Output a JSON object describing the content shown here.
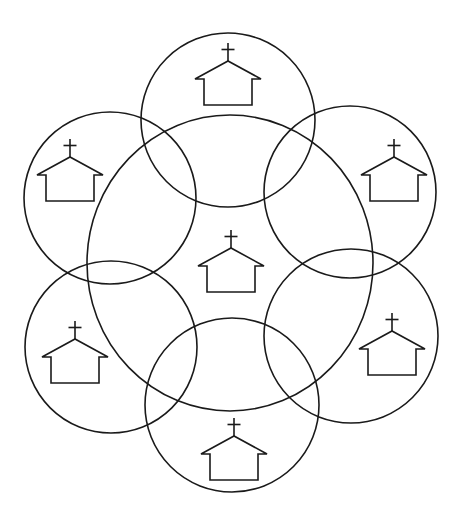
{
  "diagram": {
    "stroke_color": "#1a1a1a",
    "background_color": "#ffffff",
    "center_circle": {
      "name": "center",
      "cx": 230,
      "cy": 263,
      "rx": 143,
      "ry": 148,
      "church": {
        "x": 231,
        "y": 265
      }
    },
    "outer_circles": [
      {
        "name": "top",
        "cx": 228,
        "cy": 120,
        "r": 87,
        "church": {
          "x": 228,
          "y": 78
        }
      },
      {
        "name": "top-right",
        "cx": 350,
        "cy": 192,
        "r": 86,
        "church": {
          "x": 394,
          "y": 174
        }
      },
      {
        "name": "bottom-right",
        "cx": 351,
        "cy": 336,
        "r": 87,
        "church": {
          "x": 392,
          "y": 348
        }
      },
      {
        "name": "bottom",
        "cx": 232,
        "cy": 405,
        "r": 87,
        "church": {
          "x": 234,
          "y": 453
        }
      },
      {
        "name": "bottom-left",
        "cx": 111,
        "cy": 347,
        "r": 86,
        "church": {
          "x": 75,
          "y": 356
        }
      },
      {
        "name": "top-left",
        "cx": 110,
        "cy": 198,
        "r": 86,
        "church": {
          "x": 70,
          "y": 174
        }
      }
    ],
    "icon": "church-icon"
  }
}
